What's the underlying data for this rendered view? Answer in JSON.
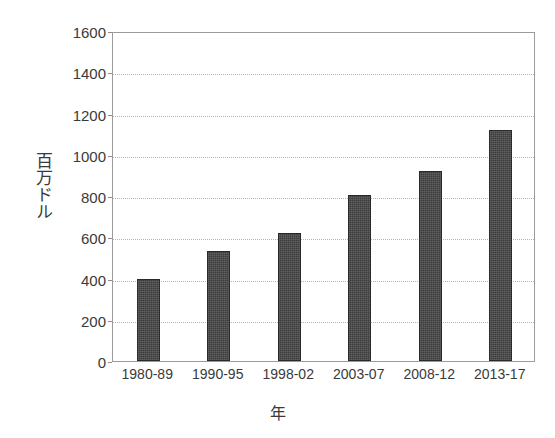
{
  "chart_data": {
    "type": "bar",
    "title": "",
    "subtitle": "",
    "xlabel": "年",
    "ylabel": "百万ドル",
    "categories": [
      "1980-89",
      "1990-95",
      "1998-02",
      "2003-07",
      "2008-12",
      "2013-17"
    ],
    "values": [
      400,
      533,
      620,
      805,
      920,
      1120
    ],
    "series": [
      {
        "name": "",
        "values": [
          400,
          533,
          620,
          805,
          920,
          1120
        ]
      }
    ],
    "ylim": [
      0,
      1600
    ],
    "ytick_step": 200,
    "ytick_labels": [
      "0",
      "200",
      "400",
      "600",
      "800",
      "1000",
      "1200",
      "1400",
      "1600"
    ],
    "ytick_values": [
      0,
      200,
      400,
      600,
      800,
      1000,
      1200,
      1400,
      1600
    ],
    "grid": "horizontal-dotted",
    "legend": "none",
    "legend_position": "none",
    "bar_color": "#3c3c3c",
    "gridline_color": "#b5b5b5",
    "axis_color": "#9b9b9b",
    "background_color": "#ffffff"
  }
}
